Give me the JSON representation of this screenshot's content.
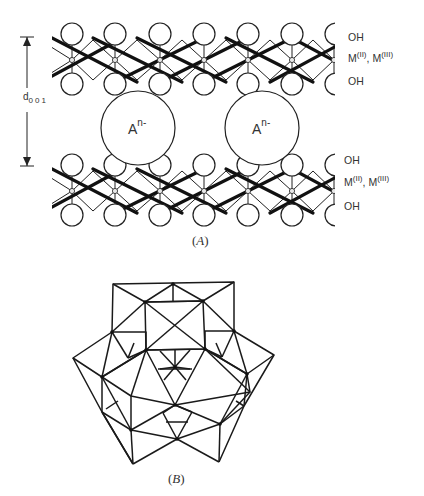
{
  "figure_a": {
    "caption": "A",
    "spacing_label": {
      "main": "d",
      "sub": "001"
    },
    "anion": {
      "main": "A",
      "sup": "n-"
    },
    "layer_labels_upper": {
      "top": "OH",
      "metal_main_1": "M",
      "metal_sup_1": "(II)",
      "sep": ", ",
      "metal_main_2": "M",
      "metal_sup_2": "(III)",
      "bottom": "OH"
    },
    "layer_labels_lower": {
      "top": "OH",
      "metal_main_1": "M",
      "metal_sup_1": "(II)",
      "sep": ", ",
      "metal_main_2": "M",
      "metal_sup_2": "(III)",
      "bottom": "OH"
    }
  },
  "figure_b": {
    "caption": "B"
  },
  "colors": {
    "ink": "#222222",
    "background": "#ffffff"
  }
}
